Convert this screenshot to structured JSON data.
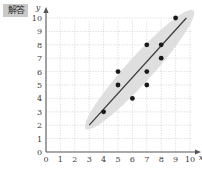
{
  "watermark": {
    "name": "watermark-badge",
    "text": "解答"
  },
  "colors": {
    "background": "#ffffff",
    "grid": "#c4c4c4",
    "axis": "#555555",
    "point": "#1a1a1a",
    "line": "#3a3a3a",
    "band": "#d9d9d9",
    "tick_text": "#3a3a3a"
  },
  "chart_data": {
    "type": "scatter",
    "title": "",
    "xlabel": "x",
    "ylabel": "y",
    "xlim": [
      0,
      10
    ],
    "ylim": [
      0,
      10
    ],
    "xticks": [
      0,
      1,
      2,
      3,
      4,
      5,
      6,
      7,
      8,
      9,
      10
    ],
    "yticks": [
      0,
      1,
      2,
      3,
      4,
      5,
      6,
      7,
      8,
      9,
      10
    ],
    "xtick_labels": [
      "0",
      "1",
      "2",
      "3",
      "4",
      "5",
      "6",
      "7",
      "8",
      "9",
      "10"
    ],
    "ytick_labels": [
      "0",
      "1",
      "2",
      "3",
      "4",
      "5",
      "6",
      "7",
      "8",
      "9",
      "10"
    ],
    "grid": true,
    "legend": null,
    "points": [
      {
        "x": 4,
        "y": 3
      },
      {
        "x": 5,
        "y": 5
      },
      {
        "x": 5,
        "y": 6
      },
      {
        "x": 6,
        "y": 4
      },
      {
        "x": 7,
        "y": 5
      },
      {
        "x": 7,
        "y": 6
      },
      {
        "x": 7,
        "y": 8
      },
      {
        "x": 8,
        "y": 7
      },
      {
        "x": 8,
        "y": 8
      },
      {
        "x": 9,
        "y": 10
      }
    ],
    "trend_line": {
      "type": "line",
      "x": [
        3,
        10
      ],
      "y": [
        2,
        10.3
      ],
      "slope": 1.18,
      "intercept": -1.55
    },
    "band": {
      "type": "area",
      "description": "shaded elliptical confidence band around trend line",
      "x": [
        3,
        10
      ],
      "lower": [
        1.2,
        9.1
      ],
      "upper": [
        3.2,
        11.0
      ]
    }
  }
}
